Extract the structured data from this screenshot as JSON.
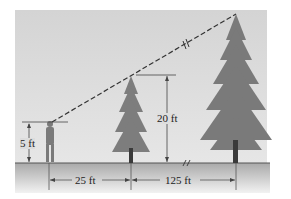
{
  "diagram": {
    "labels": {
      "person_height": "5 ft",
      "small_tree_height": "20 ft",
      "dist_person_to_small_tree": "25 ft",
      "dist_small_to_tall_tree": "125 ft"
    },
    "elements": [
      "person",
      "small-tree",
      "tall-tree",
      "sight-line",
      "ground"
    ],
    "colors": {
      "sky": "#d9d9d9",
      "ground": "#bdbdbd",
      "tree": "#6f6f6f",
      "line": "#333333"
    }
  }
}
